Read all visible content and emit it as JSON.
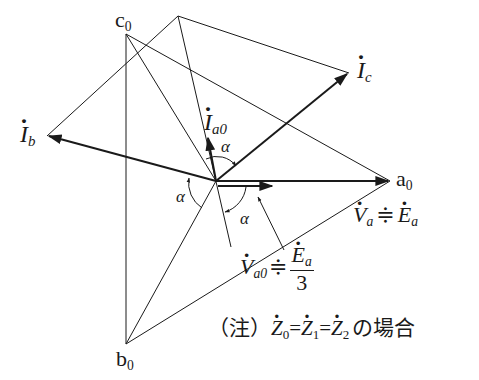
{
  "diagram": {
    "type": "phasor diagram",
    "points": {
      "c0": "c",
      "a0": "a",
      "b0": "b",
      "zero_sub": "0"
    },
    "currents": {
      "Ib": {
        "main": "I",
        "sub": "b"
      },
      "Ic": {
        "main": "I",
        "sub": "c"
      },
      "Ia0": {
        "main": "I",
        "sub": "a0"
      }
    },
    "angle_label": "α",
    "voltages": {
      "Va": {
        "main": "V",
        "sub": "a",
        "approx": "≑",
        "rhs_main": "E",
        "rhs_sub": "a"
      },
      "Va0": {
        "main": "V",
        "sub": "a0",
        "approx": "≑",
        "num_main": "E",
        "num_sub": "a",
        "den": "3"
      }
    },
    "note": {
      "prefix": "（注）",
      "z": "Z",
      "z0": "0",
      "z1": "1",
      "z2": "2",
      "eq": "=",
      "suffix": "の場合"
    }
  }
}
